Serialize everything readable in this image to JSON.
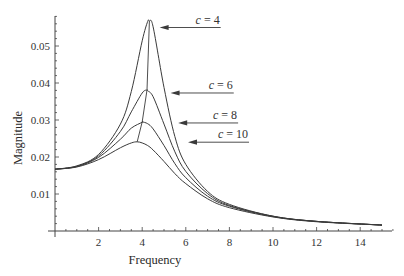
{
  "chart_data": {
    "type": "line",
    "title": "",
    "xlabel": "Frequency",
    "ylabel": "Magnitude",
    "xlim": [
      0,
      15.5
    ],
    "ylim": [
      0,
      0.058
    ],
    "grid": false,
    "legend": "annotations with arrows",
    "x_ticks": [
      2,
      4,
      6,
      8,
      10,
      12,
      14
    ],
    "x_tick_labels": [
      "2",
      "4",
      "6",
      "8",
      "10",
      "12",
      "14"
    ],
    "y_ticks": [
      0.01,
      0.02,
      0.03,
      0.04,
      0.05
    ],
    "y_tick_labels": [
      "0.01",
      "0.02",
      "0.03",
      "0.04",
      "0.05"
    ],
    "x": [
      0,
      1,
      2,
      3,
      3.5,
      4,
      4.25,
      4.5,
      5,
      5.5,
      6,
      7,
      8,
      10,
      12,
      15
    ],
    "series": [
      {
        "name": "c = 4",
        "values": [
          0.0167,
          0.0176,
          0.0207,
          0.0289,
          0.0377,
          0.0514,
          0.0566,
          0.0552,
          0.0388,
          0.0255,
          0.018,
          0.0107,
          0.0072,
          0.004,
          0.0026,
          0.0016
        ]
      },
      {
        "name": "c = 6",
        "values": [
          0.0167,
          0.0175,
          0.0203,
          0.0269,
          0.0322,
          0.0373,
          0.0379,
          0.0363,
          0.0289,
          0.0214,
          0.0161,
          0.0101,
          0.0069,
          0.004,
          0.0026,
          0.0016
        ]
      },
      {
        "name": "c = 8",
        "values": [
          0.0167,
          0.0174,
          0.0199,
          0.0248,
          0.0278,
          0.0294,
          0.029,
          0.0276,
          0.0231,
          0.0182,
          0.0144,
          0.0094,
          0.0067,
          0.0039,
          0.0026,
          0.0016
        ]
      },
      {
        "name": "c = 10",
        "values": [
          0.0167,
          0.0173,
          0.0193,
          0.0225,
          0.0238,
          0.0238,
          0.0231,
          0.0219,
          0.0188,
          0.0155,
          0.0128,
          0.0087,
          0.0063,
          0.0038,
          0.0025,
          0.0016
        ]
      }
    ],
    "peaks": [
      {
        "name": "c = 4",
        "x": 4.33,
        "y": 0.0567
      },
      {
        "name": "c = 6",
        "x": 4.22,
        "y": 0.0381
      },
      {
        "name": "c = 8",
        "x": 4.0,
        "y": 0.0295
      },
      {
        "name": "c = 10",
        "x": 3.77,
        "y": 0.0241
      }
    ],
    "peak_locus_line": true,
    "annotations": [
      {
        "label_var": "c",
        "label_value": "4",
        "arrow_to": [
          4.8,
          0.055
        ],
        "line_end_x": 7.6
      },
      {
        "label_var": "c",
        "label_value": "6",
        "arrow_to": [
          5.3,
          0.0373
        ],
        "line_end_x": 8.2
      },
      {
        "label_var": "c",
        "label_value": "8",
        "arrow_to": [
          5.65,
          0.0292
        ],
        "line_end_x": 8.4
      },
      {
        "label_var": "c",
        "label_value": "10",
        "arrow_to": [
          6.1,
          0.024
        ],
        "line_end_x": 8.9
      }
    ]
  },
  "colors": {
    "curve": "#3a3a3a",
    "axis": "#444444",
    "text": "#333333",
    "background": "#ffffff"
  }
}
